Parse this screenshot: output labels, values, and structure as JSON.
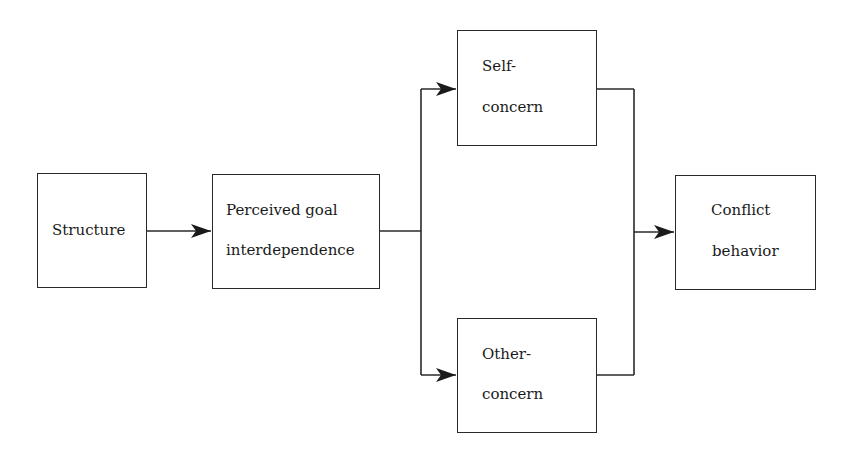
{
  "diagram": {
    "type": "flow",
    "nodes": [
      {
        "id": "structure",
        "lines": [
          "Structure"
        ]
      },
      {
        "id": "perceived",
        "lines": [
          "Perceived goal",
          "interdependence"
        ]
      },
      {
        "id": "self",
        "lines": [
          "Self-",
          "concern"
        ]
      },
      {
        "id": "other",
        "lines": [
          "Other-",
          "concern"
        ]
      },
      {
        "id": "conflict",
        "lines": [
          "Conflict",
          "behavior"
        ]
      }
    ],
    "edges": [
      {
        "from": "structure",
        "to": "perceived"
      },
      {
        "from": "perceived",
        "to": "self"
      },
      {
        "from": "perceived",
        "to": "other"
      },
      {
        "from": "self",
        "to": "conflict"
      },
      {
        "from": "other",
        "to": "conflict"
      }
    ],
    "stroke_color": "#2a2a2a"
  }
}
